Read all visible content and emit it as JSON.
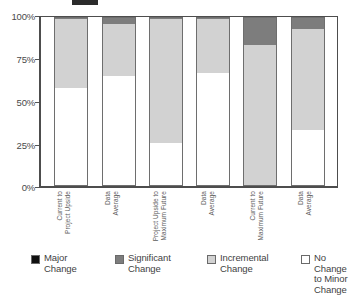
{
  "chart_data": {
    "type": "bar",
    "subtype": "stacked-100-percent",
    "title": "",
    "xlabel": "",
    "ylabel": "",
    "ylim": [
      0,
      100
    ],
    "ytick_labels": [
      "100%",
      "75%",
      "50%",
      "25%",
      "0%"
    ],
    "ytick_values": [
      100,
      75,
      50,
      25,
      0
    ],
    "grid": false,
    "legend_position": "bottom",
    "categories": [
      "Current to Project Upside",
      "Data Average",
      "Project Upside to Maximum Future",
      "Data Average",
      "Current to Maximum Future",
      "Data Average"
    ],
    "category_lines": [
      [
        "Current to",
        "Project Upside"
      ],
      [
        "Data",
        "Average"
      ],
      [
        "Project Upside to",
        "Maximum Future"
      ],
      [
        "Data",
        "Average"
      ],
      [
        "Current to",
        "Maximum Future"
      ],
      [
        "Data",
        "Average"
      ]
    ],
    "series": [
      {
        "name": "Major Change",
        "color": "#101010",
        "values": [
          0,
          0,
          0,
          0,
          0,
          0
        ]
      },
      {
        "name": "Significant Change",
        "color": "#7d7d7d",
        "values": [
          0,
          3,
          0,
          0,
          16,
          6
        ]
      },
      {
        "name": "Incremental Change",
        "color": "#d2d2d2",
        "values": [
          42,
          32,
          75,
          33,
          84,
          61
        ]
      },
      {
        "name": "No Change to Minor Change",
        "color": "#ffffff",
        "values": [
          58,
          65,
          25,
          67,
          0,
          33
        ]
      }
    ],
    "bars": [
      {
        "category": "Current to Project Upside",
        "no_change": 58,
        "incremental": 42,
        "significant": 0,
        "major": 0
      },
      {
        "category": "Data Average",
        "no_change": 65,
        "incremental": 32,
        "significant": 3,
        "major": 0
      },
      {
        "category": "Project Upside to Maximum Future",
        "no_change": 25,
        "incremental": 75,
        "significant": 0,
        "major": 0
      },
      {
        "category": "Data Average",
        "no_change": 67,
        "incremental": 33,
        "significant": 0,
        "major": 0
      },
      {
        "category": "Current to Maximum Future",
        "no_change": 0,
        "incremental": 84,
        "significant": 16,
        "major": 0
      },
      {
        "category": "Data Average",
        "no_change": 33,
        "incremental": 61,
        "significant": 6,
        "major": 0
      }
    ],
    "legend": [
      {
        "label": "Major\nChange",
        "color": "#101010"
      },
      {
        "label": "Significant\nChange",
        "color": "#7d7d7d"
      },
      {
        "label": "Incremental\nChange",
        "color": "#d2d2d2"
      },
      {
        "label": "No Change\nto Minor\nChange",
        "color": "#ffffff"
      }
    ]
  },
  "axis": {
    "y": {
      "t0": "100%",
      "t1": "75%",
      "t2": "50%",
      "t3": "25%",
      "t4": "0%"
    }
  },
  "xlabels": {
    "b0l0": "Current to",
    "b0l1": "Project Upside",
    "b1l0": "Data",
    "b1l1": "Average",
    "b2l0": "Project Upside to",
    "b2l1": "Maximum Future",
    "b3l0": "Data",
    "b3l1": "Average",
    "b4l0": "Current to",
    "b4l1": "Maximum Future",
    "b5l0": "Data",
    "b5l1": "Average"
  },
  "legend": {
    "i0": "Major\nChange",
    "i1": "Significant\nChange",
    "i2": "Incremental\nChange",
    "i3": "No Change\nto Minor\nChange"
  },
  "colors": {
    "major": "#101010",
    "significant": "#7d7d7d",
    "incremental": "#d2d2d2",
    "no_change": "#ffffff",
    "axis": "#4d4d4d",
    "text": "#3f3f3f"
  }
}
